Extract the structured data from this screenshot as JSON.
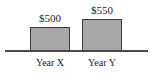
{
  "chart_data": {
    "type": "bar",
    "title": "",
    "subtitle": "",
    "xlabel": "",
    "ylabel": "",
    "categories": [
      "Year X",
      "Year Y"
    ],
    "values": [
      500,
      550
    ],
    "value_labels": [
      "$500",
      "$550"
    ],
    "series": [
      {
        "name": "",
        "values": [
          500,
          550
        ]
      }
    ],
    "ylim": [
      0,
      660
    ],
    "grid": false,
    "legend": null,
    "annotations": [],
    "colors": {
      "bar_fill": "#a8a8a8",
      "bar_border": "#3a3a3a",
      "axis": "#4a4a4a",
      "text": "#1a1a1a",
      "background": "#ffffff"
    }
  }
}
